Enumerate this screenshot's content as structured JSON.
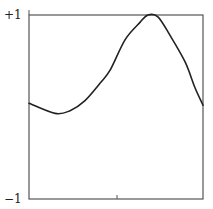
{
  "chart_data": {
    "type": "line",
    "title": "",
    "xlabel": "",
    "ylabel": "",
    "ylim": [
      -1,
      1
    ],
    "xlim": [
      0,
      1
    ],
    "grid": false,
    "legend": null,
    "y_tick_labels": [
      "+1",
      "-1"
    ],
    "x_tick_labels": [],
    "x_ticks": [
      0.5
    ],
    "series": [
      {
        "name": "curve",
        "color": "#222222",
        "x": [
          0.0,
          0.15,
          0.236,
          0.322,
          0.409,
          0.466,
          0.552,
          0.638,
          0.684,
          0.741,
          0.81,
          0.897,
          0.954,
          1.0
        ],
        "y": [
          0.04,
          -0.07,
          -0.04,
          0.07,
          0.26,
          0.4,
          0.73,
          0.92,
          1.0,
          0.98,
          0.78,
          0.49,
          0.21,
          0.02
        ]
      }
    ]
  },
  "axes": {
    "y_top_label": "+1",
    "y_bottom_label": "−1"
  },
  "colors": {
    "frame": "#555555",
    "line": "#222222",
    "background": "#ffffff"
  }
}
